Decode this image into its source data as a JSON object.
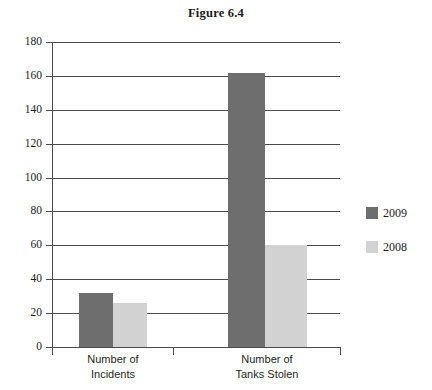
{
  "figure": {
    "title": "Figure 6.4"
  },
  "legend": {
    "position": "right",
    "items": [
      {
        "label": "2009",
        "color": "#6e6e6e"
      },
      {
        "label": "2008",
        "color": "#d2d2d2"
      }
    ]
  },
  "axis": {
    "y_ticks": [
      "180",
      "160",
      "140",
      "120",
      "100",
      "80",
      "60",
      "40",
      "20",
      "0"
    ],
    "x_categories": [
      {
        "line1": "Number of",
        "line2": "Incidents"
      },
      {
        "line1": "Number of",
        "line2": "Tanks Stolen"
      }
    ]
  },
  "chart_data": {
    "type": "bar",
    "title": "Figure 6.4",
    "xlabel": "",
    "ylabel": "",
    "ylim": [
      0,
      180
    ],
    "ytick_step": 20,
    "grid": true,
    "legend_position": "right",
    "categories": [
      "Number of Incidents",
      "Number of Tanks Stolen"
    ],
    "series": [
      {
        "name": "2009",
        "color": "#6e6e6e",
        "values": [
          32,
          162
        ]
      },
      {
        "name": "2008",
        "color": "#d2d2d2",
        "values": [
          26,
          60
        ]
      }
    ]
  }
}
